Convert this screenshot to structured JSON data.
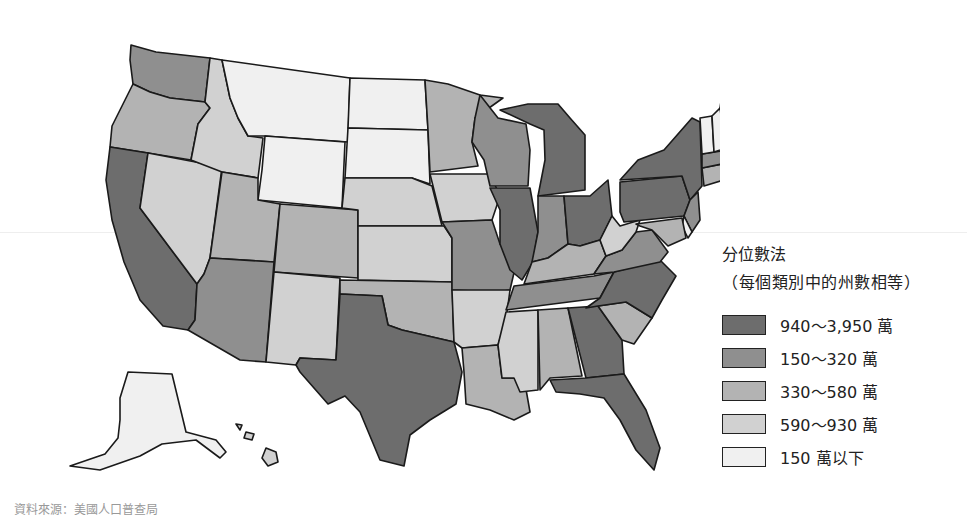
{
  "legend": {
    "title": "分位數法",
    "subtitle": "（每個類別中的州數相等）",
    "classes": [
      {
        "label": "940～3,950 萬",
        "color": "#6d6d6d"
      },
      {
        "label": "150～320 萬",
        "color": "#8f8f8f"
      },
      {
        "label": "330～580 萬",
        "color": "#b3b3b3"
      },
      {
        "label": "590～930 萬",
        "color": "#d1d1d1"
      },
      {
        "label": "150 萬以下",
        "color": "#f0f0f0"
      }
    ]
  },
  "map": {
    "subject": "United States population by state (choropleth, quantile classification)",
    "states": {
      "WA": 1,
      "OR": 2,
      "CA": 0,
      "NV": 3,
      "ID": 3,
      "MT": 4,
      "WY": 4,
      "UT": 2,
      "AZ": 1,
      "CO": 2,
      "NM": 3,
      "ND": 4,
      "SD": 4,
      "NE": 3,
      "KS": 3,
      "OK": 2,
      "TX": 0,
      "MN": 2,
      "IA": 3,
      "MO": 1,
      "AR": 3,
      "LA": 2,
      "WI": 1,
      "IL": 0,
      "MI": 0,
      "IN": 1,
      "OH": 0,
      "KY": 2,
      "TN": 1,
      "MS": 3,
      "AL": 2,
      "GA": 0,
      "FL": 0,
      "SC": 2,
      "NC": 0,
      "VA": 1,
      "WV": 3,
      "PA": 0,
      "NY": 0,
      "NJ": 1,
      "DE": 4,
      "MD": 2,
      "CT": 2,
      "RI": 4,
      "MA": 1,
      "VT": 4,
      "NH": 4,
      "ME": 4,
      "AK": 4,
      "HI": 3
    }
  },
  "source_text": "資料來源：美國人口普查局"
}
